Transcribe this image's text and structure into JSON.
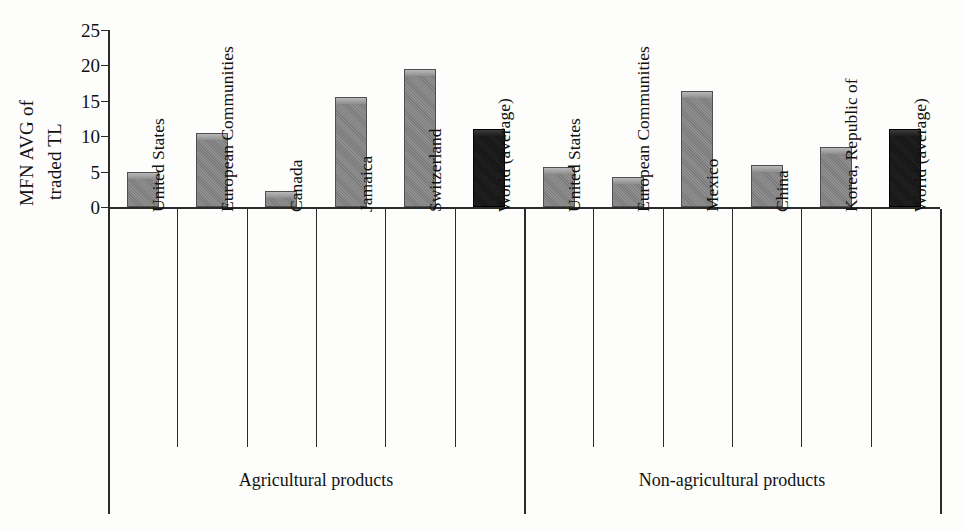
{
  "chart_data": {
    "type": "bar",
    "title": "",
    "xlabel": "",
    "ylabel": "MFN AVG of traded TL",
    "ylabel_line1": "MFN AVG of",
    "ylabel_line2": "traded TL",
    "ylim": [
      0,
      25
    ],
    "yticks": [
      0,
      5,
      10,
      15,
      20,
      25
    ],
    "ytick_labels": [
      "0",
      "5",
      "10",
      "15",
      "20",
      "25"
    ],
    "grid": false,
    "legend": false,
    "categories": [
      "United States",
      "European Communities",
      "Canada",
      "Jamaica",
      "Switzerland",
      "World (average)",
      "United States",
      "European Communities",
      "Mexico",
      "China",
      "Korea, Republic of",
      "World (average)"
    ],
    "values": [
      4.9,
      10.5,
      2.2,
      15.5,
      19.5,
      11.0,
      5.6,
      4.2,
      16.4,
      5.9,
      8.5,
      11.0
    ],
    "bar_colors": [
      "#7b7b7b",
      "#7b7b7b",
      "#7b7b7b",
      "#7b7b7b",
      "#7b7b7b",
      "#151515",
      "#7b7b7b",
      "#7b7b7b",
      "#7b7b7b",
      "#7b7b7b",
      "#7b7b7b",
      "#151515"
    ],
    "groups": [
      {
        "label": "Agricultural products",
        "categories": [
          "United States",
          "European Communities",
          "Canada",
          "Jamaica",
          "Switzerland",
          "World (average)"
        ],
        "values": [
          4.9,
          10.5,
          2.2,
          15.5,
          19.5,
          11.0
        ]
      },
      {
        "label": "Non-agricultural products",
        "categories": [
          "United States",
          "European Communities",
          "Mexico",
          "China",
          "Korea, Republic of",
          "World (average)"
        ],
        "values": [
          5.6,
          4.2,
          16.4,
          5.9,
          8.5,
          11.0
        ]
      }
    ],
    "accent_color": "#7b7b7b",
    "highlight_color": "#151515",
    "axis_color": "#2b2b2b"
  }
}
